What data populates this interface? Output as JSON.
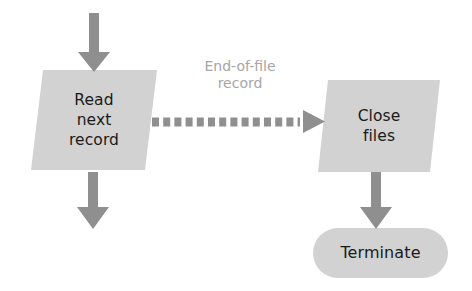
{
  "diagram": {
    "type": "flowchart",
    "background_color": "#ffffff",
    "shape_fill_color": "#d2d2d2",
    "arrow_color": "#8f8f8f",
    "node_text_color": "#1a1a1a",
    "edge_label_color": "#a6a6a6",
    "nodes": [
      {
        "id": "read-next-record",
        "shape": "parallelogram",
        "role": "input-output",
        "lines": [
          "Read",
          "next",
          "record"
        ]
      },
      {
        "id": "close-files",
        "shape": "parallelogram",
        "role": "input-output",
        "lines": [
          "Close",
          "files"
        ]
      },
      {
        "id": "terminate",
        "shape": "stadium",
        "role": "terminator",
        "lines": [
          "Terminate"
        ]
      }
    ],
    "edges": [
      {
        "id": "entry-to-read",
        "style": "solid",
        "direction": "down",
        "label": ""
      },
      {
        "id": "read-to-close",
        "style": "dashed",
        "direction": "right",
        "label_lines": [
          "End-of-file",
          "record"
        ]
      },
      {
        "id": "read-to-exit",
        "style": "solid",
        "direction": "down",
        "label": ""
      },
      {
        "id": "close-to-terminate",
        "style": "solid",
        "direction": "down",
        "label": ""
      }
    ]
  }
}
